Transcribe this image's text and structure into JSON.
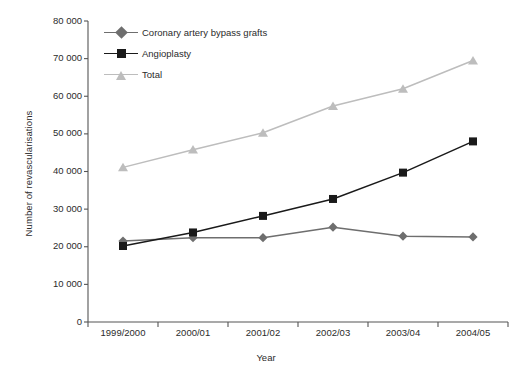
{
  "chart_data": {
    "type": "line",
    "title": "",
    "xlabel": "Year",
    "ylabel": "Number of revascularisations",
    "categories": [
      "1999/2000",
      "2000/01",
      "2001/02",
      "2002/03",
      "2003/04",
      "2004/05"
    ],
    "ylim": [
      0,
      80000
    ],
    "yticks": [
      0,
      10000,
      20000,
      30000,
      40000,
      50000,
      60000,
      70000,
      80000
    ],
    "ytick_labels": [
      "0",
      "10 000",
      "20 000",
      "30 000",
      "40 000",
      "50 000",
      "60 000",
      "70 000",
      "80 000"
    ],
    "grid": false,
    "legend_position": "upper-left-inside",
    "series": [
      {
        "name": "Coronary artery bypass grafts",
        "marker": "diamond",
        "color": "#6e6e6e",
        "values": [
          21500,
          22400,
          22400,
          25200,
          22800,
          22600
        ]
      },
      {
        "name": "Angioplasty",
        "marker": "square",
        "color": "#1a1a1a",
        "values": [
          20200,
          23800,
          28200,
          32700,
          39700,
          48000
        ]
      },
      {
        "name": "Total",
        "marker": "triangle",
        "color": "#bdbdbd",
        "values": [
          41100,
          45800,
          50300,
          57400,
          62000,
          69500
        ]
      }
    ]
  },
  "axes": {
    "axis_color": "#555555",
    "tick_color": "#555555",
    "text_color": "#2b2b2b"
  }
}
